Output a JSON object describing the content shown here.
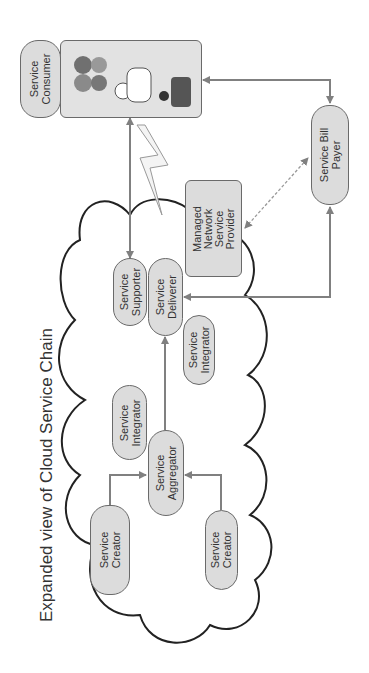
{
  "diagram": {
    "title": "Expanded view of Cloud Service Chain",
    "orientation": "rotated 90 degrees counter-clockwise",
    "nodes": {
      "consumer": {
        "line1": "Service",
        "line2": "Consumer"
      },
      "bill_payer": {
        "line1": "Service Bill",
        "line2": "Payer"
      },
      "mnsp": {
        "line1": "Managed",
        "line2": "Network",
        "line3": "Service",
        "line4": "Provider"
      },
      "supporter": {
        "line1": "Service",
        "line2": "Supporter"
      },
      "deliverer": {
        "line1": "Service",
        "line2": "Deliverer"
      },
      "integrator_a": {
        "line1": "Service",
        "line2": "Integrator"
      },
      "integrator_b": {
        "line1": "Service",
        "line2": "Integrator"
      },
      "aggregator": {
        "line1": "Service",
        "line2": "Aggregator"
      },
      "creator_a": {
        "line1": "Service",
        "line2": "Creator"
      },
      "creator_b": {
        "line1": "Service",
        "line2": "Creator"
      }
    },
    "edges": [
      {
        "from": "Service Creator",
        "to": "Service Aggregator"
      },
      {
        "from": "Service Creator",
        "to": "Service Aggregator"
      },
      {
        "from": "Service Aggregator",
        "to": "Service Deliverer"
      },
      {
        "from": "Service Consumer",
        "to": "Service Supporter"
      },
      {
        "from": "Service Bill Payer",
        "to": "Service Deliverer"
      },
      {
        "from": "Service Consumer",
        "to": "Service Bill Payer",
        "bidirectional": true
      },
      {
        "from": "Managed Network Service Provider",
        "to": "Service Bill Payer",
        "style": "dashed",
        "bidirectional": true
      }
    ],
    "colors": {
      "node_fill": "#dcdcdc",
      "node_border": "#6a6a6a",
      "arrow": "#808080",
      "cloud": "#222222"
    }
  }
}
